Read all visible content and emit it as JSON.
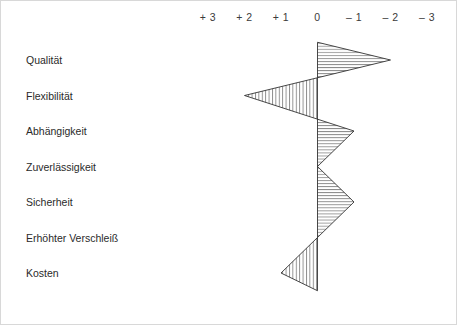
{
  "chart_data": {
    "type": "line",
    "title": "",
    "subtitle": "",
    "xlabel": "",
    "ylabel": "",
    "categories": [
      "Qualität",
      "Flexibilität",
      "Abhängigkeit",
      "Zuverlässigkeit",
      "Sicherheit",
      "Erhöhter Verschleiß",
      "Kosten"
    ],
    "values": [
      -2,
      2,
      -1,
      0,
      -1,
      0,
      1
    ],
    "series": [
      {
        "name": "Bewertung",
        "values": [
          -2,
          2,
          -1,
          0,
          -1,
          0,
          1
        ]
      }
    ],
    "axis_tick_labels": [
      "+ 3",
      "+ 2",
      "+ 1",
      "0",
      "– 1",
      "– 2",
      "– 3"
    ],
    "axis_tick_values": [
      3,
      2,
      1,
      0,
      -1,
      -2,
      -3
    ],
    "xlim": [
      3,
      -3
    ],
    "axis_direction": "positive-left",
    "grid": false,
    "legend": null,
    "zero_axis_value": 0,
    "fill_style": "hatched",
    "colors": {
      "line": "#333333",
      "hatch": "#555555",
      "text": "#2a2a2a",
      "axis_text": "#3b3b3b",
      "frame": "#d8d8d8",
      "background": "#ffffff"
    }
  },
  "layout": {
    "axis_label_row_y": 17,
    "zero_x": 317.5,
    "tick_spacing_px": 36.5,
    "row_start_y": 60,
    "row_spacing_px": 35.5
  }
}
